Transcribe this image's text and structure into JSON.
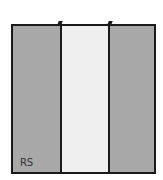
{
  "diagram": {
    "panels": [
      {
        "id": "left",
        "fill": "#a8a8a8"
      },
      {
        "id": "center",
        "fill": "#efefef"
      },
      {
        "id": "right",
        "fill": "#a8a8a8"
      }
    ],
    "border_color": "#1a1a1a",
    "label": "RS"
  }
}
